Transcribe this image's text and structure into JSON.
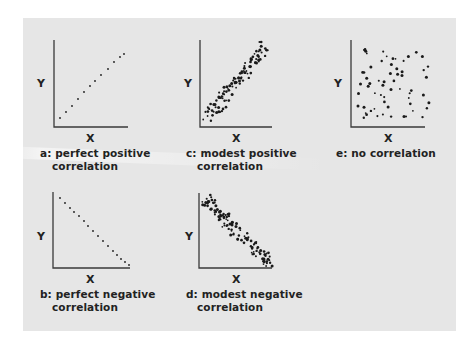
{
  "figure": {
    "background": "#e6e6e6",
    "point_color": "#1a1a1a",
    "axis_color": "#3a3a3a"
  },
  "panels": [
    {
      "id": "a",
      "title_line1": "a: perfect positive",
      "title_line2": "correlation",
      "x_label": "X",
      "y_label": "Y",
      "axis": {
        "x0": 54,
        "y0": 127,
        "x1": 128,
        "ytop": 40
      },
      "points": [
        [
          60,
          118
        ],
        [
          66,
          112
        ],
        [
          72,
          106
        ],
        [
          78,
          99
        ],
        [
          84,
          92
        ],
        [
          90,
          86
        ],
        [
          95,
          81
        ],
        [
          101,
          75
        ],
        [
          108,
          69
        ],
        [
          114,
          62
        ],
        [
          120,
          57
        ],
        [
          124,
          54
        ]
      ]
    },
    {
      "id": "c",
      "title_line1": "c: modest positive",
      "title_line2": "correlation",
      "x_label": "X",
      "y_label": "Y",
      "axis": {
        "x0": 200,
        "y0": 127,
        "x1": 272,
        "ytop": 40
      },
      "points": []
    },
    {
      "id": "e",
      "title_line1": "e: no correlation",
      "title_line2": "",
      "x_label": "X",
      "y_label": "Y",
      "axis": {
        "x0": 351,
        "y0": 127,
        "x1": 425,
        "ytop": 40
      },
      "points": []
    },
    {
      "id": "b",
      "title_line1": "b: perfect negative",
      "title_line2": "correlation",
      "x_label": "X",
      "y_label": "Y",
      "axis": {
        "x0": 53,
        "y0": 268,
        "x1": 130,
        "ytop": 192
      },
      "points": [
        [
          60,
          198
        ],
        [
          65,
          203
        ],
        [
          70,
          208
        ],
        [
          74,
          212
        ],
        [
          79,
          216
        ],
        [
          84,
          221
        ],
        [
          88,
          226
        ],
        [
          93,
          231
        ],
        [
          98,
          236
        ],
        [
          103,
          241
        ],
        [
          108,
          246
        ],
        [
          113,
          251
        ],
        [
          117,
          255
        ],
        [
          121,
          259
        ],
        [
          125,
          262
        ],
        [
          129,
          265
        ]
      ]
    },
    {
      "id": "d",
      "title_line1": "d: modest negative",
      "title_line2": "correlation",
      "x_label": "X",
      "y_label": "Y",
      "axis": {
        "x0": 199,
        "y0": 268,
        "x1": 272,
        "ytop": 193
      },
      "points": []
    }
  ],
  "chart_data": [
    {
      "type": "scatter",
      "title": "a: perfect positive correlation",
      "xlabel": "X",
      "ylabel": "Y",
      "correlation": 1.0,
      "grid": false
    },
    {
      "type": "scatter",
      "title": "c: modest positive correlation",
      "xlabel": "X",
      "ylabel": "Y",
      "correlation": 0.7,
      "grid": false
    },
    {
      "type": "scatter",
      "title": "e: no correlation",
      "xlabel": "X",
      "ylabel": "Y",
      "correlation": 0.0,
      "grid": false
    },
    {
      "type": "scatter",
      "title": "b: perfect negative correlation",
      "xlabel": "X",
      "ylabel": "Y",
      "correlation": -1.0,
      "grid": false
    },
    {
      "type": "scatter",
      "title": "d: modest negative correlation",
      "xlabel": "X",
      "ylabel": "Y",
      "correlation": -0.7,
      "grid": false
    }
  ]
}
